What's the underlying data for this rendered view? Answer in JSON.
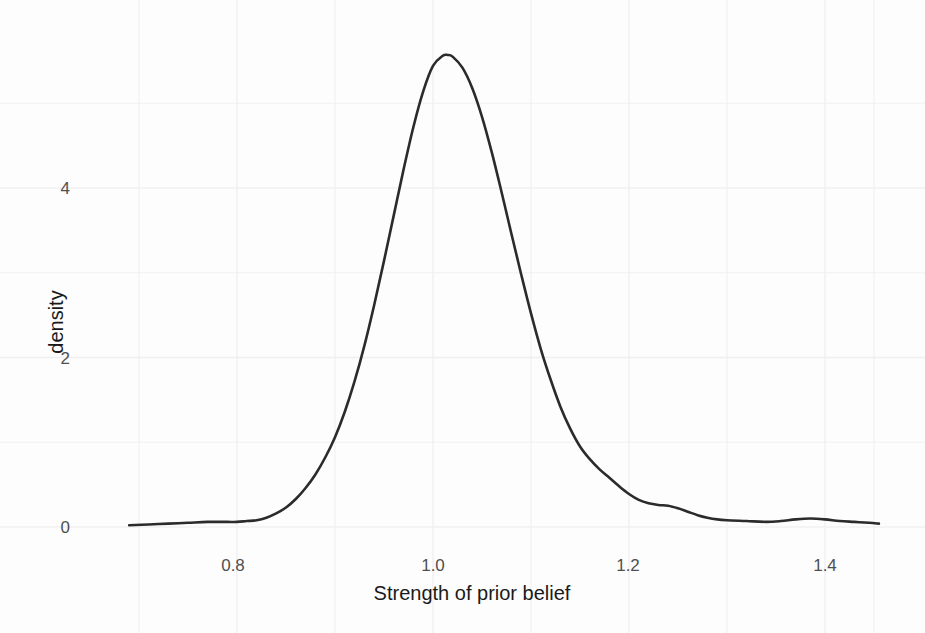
{
  "figure": {
    "background_color": "#fdfdfd",
    "panel_color": "#fdfdfd",
    "grid_color": "#f0f0f2",
    "line_color": "#2b2b2b",
    "tick_label_color": "#4f4f4f",
    "axis_title_color": "#1a1a1a"
  },
  "chart_data": {
    "type": "line",
    "title": "",
    "subtitle": "",
    "xlabel": "Strength of prior belief",
    "ylabel": "density",
    "xlim": [
      0.685,
      1.46
    ],
    "ylim": [
      -0.1,
      5.8
    ],
    "grid": true,
    "legend": false,
    "legend_position": "none",
    "x_ticks": [
      0.8,
      1.0,
      1.2,
      1.4
    ],
    "x_tick_labels": [
      "0.8",
      "1.0",
      "1.2",
      "1.4"
    ],
    "y_ticks": [
      0,
      2,
      4
    ],
    "y_tick_labels": [
      "0",
      "2",
      "4"
    ],
    "x_minor_ticks": [
      0.7,
      0.9,
      1.1,
      1.3,
      1.45
    ],
    "y_minor_ticks": [
      1,
      3,
      5
    ],
    "peak": {
      "x": 1.015,
      "y": 5.57
    },
    "series": [
      {
        "name": "density",
        "x": [
          0.69,
          0.71,
          0.73,
          0.75,
          0.77,
          0.79,
          0.8,
          0.81,
          0.82,
          0.83,
          0.84,
          0.85,
          0.86,
          0.87,
          0.88,
          0.89,
          0.9,
          0.91,
          0.92,
          0.93,
          0.94,
          0.95,
          0.96,
          0.97,
          0.98,
          0.99,
          1.0,
          1.01,
          1.015,
          1.02,
          1.03,
          1.04,
          1.05,
          1.06,
          1.07,
          1.08,
          1.09,
          1.1,
          1.11,
          1.12,
          1.13,
          1.14,
          1.15,
          1.16,
          1.17,
          1.18,
          1.19,
          1.2,
          1.21,
          1.22,
          1.23,
          1.24,
          1.25,
          1.26,
          1.27,
          1.28,
          1.29,
          1.3,
          1.32,
          1.34,
          1.355,
          1.37,
          1.385,
          1.4,
          1.415,
          1.43,
          1.445,
          1.455
        ],
        "y": [
          0.02,
          0.03,
          0.04,
          0.05,
          0.06,
          0.06,
          0.06,
          0.07,
          0.08,
          0.11,
          0.16,
          0.23,
          0.33,
          0.46,
          0.62,
          0.82,
          1.06,
          1.36,
          1.72,
          2.14,
          2.62,
          3.14,
          3.68,
          4.22,
          4.72,
          5.14,
          5.44,
          5.56,
          5.57,
          5.55,
          5.42,
          5.18,
          4.84,
          4.42,
          3.95,
          3.46,
          2.98,
          2.52,
          2.1,
          1.74,
          1.42,
          1.16,
          0.95,
          0.8,
          0.68,
          0.58,
          0.48,
          0.39,
          0.32,
          0.28,
          0.26,
          0.25,
          0.22,
          0.18,
          0.14,
          0.11,
          0.09,
          0.08,
          0.07,
          0.06,
          0.07,
          0.09,
          0.1,
          0.09,
          0.07,
          0.06,
          0.05,
          0.04
        ]
      }
    ]
  },
  "axes": {
    "x_title": "Strength of prior belief",
    "y_title": "density",
    "x_tick_labels": [
      "0.8",
      "1.0",
      "1.2",
      "1.4"
    ],
    "y_tick_labels": [
      "0",
      "2",
      "4"
    ]
  }
}
